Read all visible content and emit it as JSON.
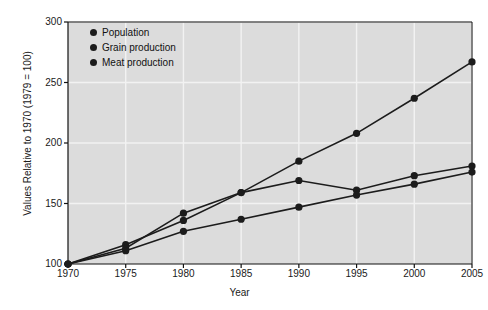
{
  "chart_data": {
    "type": "line",
    "title": "",
    "xlabel": "Year",
    "ylabel": "Values Relative to 1970 (1979 = 100)",
    "x": [
      1970,
      1975,
      1980,
      1985,
      1990,
      1995,
      2000,
      2005
    ],
    "xticklabels": [
      "1970",
      "1975",
      "1980",
      "1985",
      "1990",
      "1995",
      "2000",
      "2005"
    ],
    "yticklabels": [
      "100",
      "150",
      "200",
      "250",
      "300"
    ],
    "yticks": [
      100,
      150,
      200,
      250,
      300
    ],
    "xlim": [
      1970,
      2005
    ],
    "ylim": [
      100,
      300
    ],
    "grid": true,
    "legend_position": "top-left-inside",
    "marker": "filled-circle",
    "line_color": "#1c1c1c",
    "plot_background": "#dcdcdc",
    "figure_background": "#ffffff",
    "series": [
      {
        "name": "Population",
        "values": [
          100,
          116,
          136,
          159,
          185,
          208,
          237,
          267
        ]
      },
      {
        "name": "Grain production",
        "values": [
          100,
          113,
          142,
          159,
          169,
          161,
          173,
          181
        ]
      },
      {
        "name": "Meat production",
        "values": [
          100,
          111,
          127,
          137,
          147,
          157,
          166,
          176
        ]
      }
    ]
  },
  "legend": {
    "items": [
      {
        "label": "Population"
      },
      {
        "label": "Grain production"
      },
      {
        "label": "Meat production"
      }
    ]
  },
  "axes": {
    "x_title": "Year",
    "y_title": "Values Relative to 1970 (1979 = 100)"
  }
}
